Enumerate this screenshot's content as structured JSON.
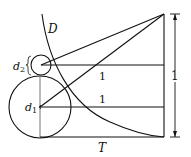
{
  "diagram": {
    "labels": {
      "curve": "D",
      "small_diameter": "d",
      "small_diameter_sub": "2",
      "large_diameter": "d",
      "large_diameter_sub": "1",
      "upper_length": "1",
      "lower_length": "1",
      "height": "1",
      "base": "T"
    },
    "colors": {
      "stroke": "#111111",
      "background": "#ffffff"
    }
  }
}
